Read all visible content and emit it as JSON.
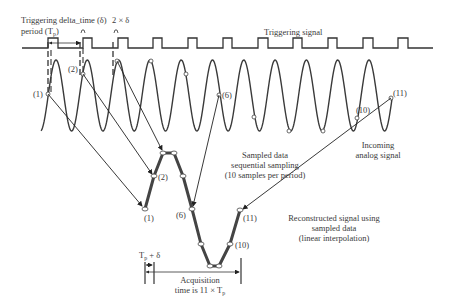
{
  "labels": {
    "triggering_period_line1": "Triggering",
    "triggering_period_line2": "period (T",
    "triggering_period_sub": "p",
    "triggering_period_close": ")",
    "delta_time": "delta_time (δ)",
    "two_delta": "2 × δ",
    "triggering_signal": "Triggering signal",
    "incoming_line1": "Incoming",
    "incoming_line2": "analog signal",
    "sampled_line1": "Sampled data",
    "sampled_line2": "sequential sampling",
    "sampled_line3": "(10 samples per period)",
    "recon_line1": "Reconstructed signal using",
    "recon_line2": "sampled data",
    "recon_line3": "(linear interpolation)",
    "tp_delta": "T",
    "tp_delta_sub": "p",
    "tp_delta_rest": " + δ",
    "acq_line1": "Acquisition",
    "acq_line2": "time is 11 × T",
    "acq_sub": "p"
  },
  "sample_labels": {
    "s1": "(1)",
    "s2": "(2)",
    "s6": "(6)",
    "s10": "(10)",
    "s11": "(11)",
    "r1": "(1)",
    "r2": "(2)",
    "r6": "(6)",
    "r10": "(10)",
    "r11": "(11)"
  },
  "colors": {
    "line": "#333333",
    "thick": "#444444",
    "text": "#3a3a3a"
  }
}
